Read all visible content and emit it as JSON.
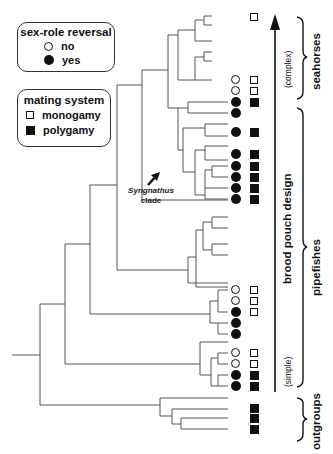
{
  "legend_sex_role": {
    "title": "sex-role reversal",
    "items": [
      {
        "symbol": "open-circle",
        "label": "no"
      },
      {
        "symbol": "filled-circle",
        "label": "yes"
      }
    ]
  },
  "legend_mating": {
    "title": "mating system",
    "items": [
      {
        "symbol": "open-square",
        "label": "monogamy"
      },
      {
        "symbol": "filled-square",
        "label": "polygamy"
      }
    ]
  },
  "clade_annotation": {
    "name": "Syngnathus",
    "suffix": "clade"
  },
  "axis": {
    "title": "brood pouch design",
    "top_label": "(complex)",
    "bottom_label": "(simple)"
  },
  "groups": [
    {
      "label": "seahorses"
    },
    {
      "label": "pipefishes"
    },
    {
      "label": "outgroups"
    }
  ],
  "tips": [
    {
      "y": 17,
      "sex_role": null,
      "mating": "mono"
    },
    {
      "y": 80,
      "sex_role": "no",
      "mating": "mono"
    },
    {
      "y": 91,
      "sex_role": "no",
      "mating": "mono"
    },
    {
      "y": 102,
      "sex_role": "yes",
      "mating": "poly"
    },
    {
      "y": 113,
      "sex_role": "yes",
      "mating": null
    },
    {
      "y": 132,
      "sex_role": "yes",
      "mating": "poly"
    },
    {
      "y": 154,
      "sex_role": "yes",
      "mating": "poly"
    },
    {
      "y": 166,
      "sex_role": "yes",
      "mating": "poly"
    },
    {
      "y": 177,
      "sex_role": "yes",
      "mating": "poly"
    },
    {
      "y": 188,
      "sex_role": "yes",
      "mating": "poly"
    },
    {
      "y": 199,
      "sex_role": "yes",
      "mating": "poly"
    },
    {
      "y": 290,
      "sex_role": "no",
      "mating": "mono"
    },
    {
      "y": 301,
      "sex_role": "no",
      "mating": "mono"
    },
    {
      "y": 312,
      "sex_role": "yes",
      "mating": "mono"
    },
    {
      "y": 323,
      "sex_role": "yes",
      "mating": null
    },
    {
      "y": 334,
      "sex_role": "yes",
      "mating": null
    },
    {
      "y": 353,
      "sex_role": "no",
      "mating": "mono"
    },
    {
      "y": 364,
      "sex_role": "no",
      "mating": "mono"
    },
    {
      "y": 375,
      "sex_role": "yes",
      "mating": "poly"
    },
    {
      "y": 386,
      "sex_role": "yes",
      "mating": "poly"
    },
    {
      "y": 408,
      "sex_role": null,
      "mating": "poly"
    },
    {
      "y": 418,
      "sex_role": null,
      "mating": "poly"
    },
    {
      "y": 429,
      "sex_role": null,
      "mating": "poly"
    }
  ],
  "colors": {
    "line": "#555555",
    "ink": "#111111",
    "background": "#ffffff"
  }
}
